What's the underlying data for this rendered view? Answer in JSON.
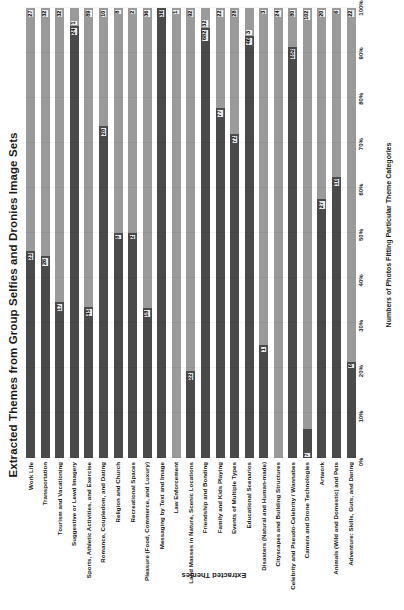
{
  "chart_data": {
    "type": "bar",
    "subtype": "100% stacked horizontal bar",
    "title": "Extracted Themes from Group Selfies and Dronies Image Sets",
    "xlabel": "Numbers of Photos Fitting Particular Theme Categories",
    "ylabel": "Extracted Themes",
    "xticks": [
      "0%",
      "10%",
      "20%",
      "30%",
      "40%",
      "50%",
      "60%",
      "70%",
      "80%",
      "90%",
      "100%"
    ],
    "xlim": [
      0,
      100
    ],
    "grid": true,
    "legend": "none",
    "series": [
      {
        "name": "Group Selfies",
        "color": "#4a4a4a"
      },
      {
        "name": "Dronies",
        "color": "#9a9a9a"
      }
    ],
    "categories": [
      "Work Life",
      "Transportation",
      "Tourism and Vacationing",
      "Suggestive or Lewd Imagery",
      "Sports, Athletic Activities, and Exercise",
      "Romance, Coupledom, and Dating",
      "Religion and Church",
      "Recreational Spaces",
      "Pleasure (Food, Commerce, and Luxury)",
      "Messaging by Text and Image",
      "Law Enforcement",
      "Land Masses in Nature, Scenic Locations",
      "Friendship and Bonding",
      "Family and Kids Playing",
      "Events of Multiple Types",
      "Educational Scenarios",
      "Disasters (Natural and Human-made)",
      "Cityscapes and Building Structures",
      "Celebrity and Pseudo-Celebrity / Wannabes",
      "Camera and Drone Technologies",
      "Artwork",
      "Animals (Wild and Domestic) and Pets",
      "Adventure:  Skills, Guts, and Daring"
    ],
    "rows": [
      {
        "category": "Work Life",
        "a": 23,
        "b": 27
      },
      {
        "category": "Transportation",
        "a": 26,
        "b": 32
      },
      {
        "category": "Tourism and Vacationing",
        "a": 17,
        "b": 32
      },
      {
        "category": "Suggestive or Lewd Imagery",
        "a": 24,
        "b": 1
      },
      {
        "category": "Sports, Athletic Activities, and Exercise",
        "a": 45,
        "b": 89
      },
      {
        "category": "Romance, Coupledom, and Dating",
        "a": 28,
        "b": 10
      },
      {
        "category": "Religion and Church",
        "a": 8,
        "b": 8
      },
      {
        "category": "Recreational Spaces",
        "a": 2,
        "b": 2
      },
      {
        "category": "Pleasure (Food, Commerce, and Luxury)",
        "a": 18,
        "b": 36
      },
      {
        "category": "Messaging by Text and Image",
        "a": 36,
        "b": 0
      },
      {
        "category": "Law Enforcement",
        "a": 0,
        "b": 1
      },
      {
        "category": "Land Masses in Nature, Scenic Locations",
        "a": 22,
        "b": 92
      },
      {
        "category": "Friendship and Bonding",
        "a": 682,
        "b": 32
      },
      {
        "category": "Family and Kids Playing",
        "a": 77,
        "b": 22
      },
      {
        "category": "Events of Multiple Types",
        "a": 72,
        "b": 28
      },
      {
        "category": "Educational Scenarios",
        "a": 46,
        "b": 3
      },
      {
        "category": "Disasters (Natural and Human-made)",
        "a": 1,
        "b": 3
      },
      {
        "category": "Cityscapes and Building Structures",
        "a": 0,
        "b": 24
      },
      {
        "category": "Celebrity and Pseudo-Celebrity / Wannabes",
        "a": 852,
        "b": 80
      },
      {
        "category": "Camera and Drone Technologies",
        "a": 7,
        "b": 102
      },
      {
        "category": "Artwork",
        "a": 27,
        "b": 20
      },
      {
        "category": "Animals (Wild and Domestic) and Pets",
        "a": 10,
        "b": 6
      },
      {
        "category": "Adventure:  Skills, Guts, and Daring",
        "a": 6,
        "b": 22
      }
    ]
  }
}
